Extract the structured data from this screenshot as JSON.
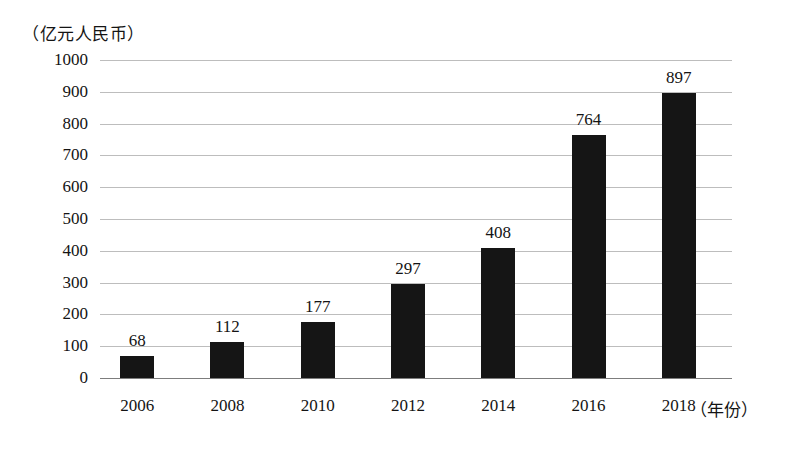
{
  "chart_data": {
    "type": "bar",
    "title": "",
    "subtitle": "",
    "xlabel": "（年份）",
    "ylabel": "（亿元人民币）",
    "categories": [
      "2006",
      "2008",
      "2010",
      "2012",
      "2014",
      "2016",
      "2018"
    ],
    "values": [
      68,
      112,
      177,
      297,
      408,
      764,
      897
    ],
    "data_labels": [
      "68",
      "112",
      "177",
      "297",
      "408",
      "764",
      "897"
    ],
    "ylim": [
      0,
      1000
    ],
    "y_ticks": [
      0,
      100,
      200,
      300,
      400,
      500,
      600,
      700,
      800,
      900,
      1000
    ],
    "y_tick_labels": [
      "0",
      "100",
      "200",
      "300",
      "400",
      "500",
      "600",
      "700",
      "800",
      "900",
      "1000"
    ],
    "grid": true,
    "grid_axis": "y",
    "legend": false,
    "legend_position": "none",
    "bar_color": "#151515",
    "gridline_color": "#bdbdbd",
    "axis_color": "#7d7d7d",
    "text_color": "#141414",
    "background_color": "#ffffff",
    "series": [
      {
        "name": "",
        "values": [
          68,
          112,
          177,
          297,
          408,
          764,
          897
        ]
      }
    ]
  }
}
